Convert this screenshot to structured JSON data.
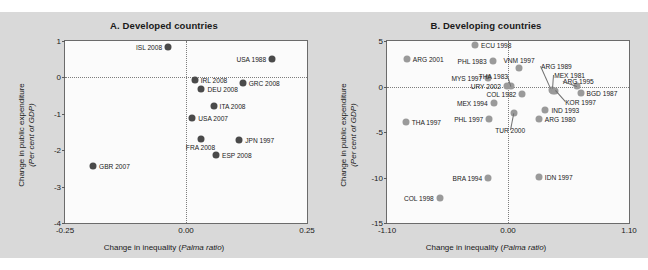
{
  "figure": {
    "background_color": "#d9d9d9",
    "plot_background_color": "#fbfbfb"
  },
  "panelA": {
    "title": "A. Developed countries",
    "xlabel_main": "Change in inequality (",
    "xlabel_italic": "Palma ratio",
    "xlabel_end": ")",
    "ylabel_line1": "Change in public expenditure",
    "ylabel_line2": "(Per cent of GDP)",
    "marker_color": "#4a4a4a"
  },
  "panelB": {
    "title": "B. Developing countries",
    "xlabel_main": "Change in inequality (",
    "xlabel_italic": "Palma ratio",
    "xlabel_end": ")",
    "ylabel_line1": "Change in public expenditure",
    "ylabel_line2": "(Per cent of GDP)",
    "marker_color": "#9a9a9a"
  },
  "chart_data": [
    {
      "type": "scatter",
      "title": "A. Developed countries",
      "xlabel": "Change in inequality (Palma ratio)",
      "ylabel": "Change in public expenditure (Per cent of GDP)",
      "xlim": [
        -0.25,
        0.25
      ],
      "ylim": [
        -4,
        1
      ],
      "xticks": [
        -0.25,
        0.0,
        0.25
      ],
      "xticklabels": [
        "-0.25",
        "0.00",
        "0.25"
      ],
      "yticks": [
        1,
        0,
        -1,
        -2,
        -3,
        -4
      ],
      "yticklabels": [
        "1",
        "0",
        "-1",
        "-2",
        "-3",
        "-4"
      ],
      "grid": false,
      "reference_lines": {
        "x": 0.0,
        "y": 0.0,
        "style": "dotted"
      },
      "legend": null,
      "points": [
        {
          "label": "ISL 2008",
          "x": -0.037,
          "y": 0.84,
          "label_side": "left"
        },
        {
          "label": "USA 1988",
          "x": 0.178,
          "y": 0.5,
          "label_side": "left"
        },
        {
          "label": "IRL 2008",
          "x": 0.018,
          "y": -0.07,
          "label_side": "right"
        },
        {
          "label": "GRC 2008",
          "x": 0.117,
          "y": -0.15,
          "label_side": "right"
        },
        {
          "label": "DEU 2008",
          "x": 0.032,
          "y": -0.33,
          "label_side": "right"
        },
        {
          "label": "ITA 2008",
          "x": 0.057,
          "y": -0.78,
          "label_side": "right"
        },
        {
          "label": "USA 2007",
          "x": 0.013,
          "y": -1.11,
          "label_side": "right"
        },
        {
          "label": "JPN 1997",
          "x": 0.11,
          "y": -1.72,
          "label_side": "right"
        },
        {
          "label": "FRA 2008",
          "x": 0.03,
          "y": -1.68,
          "label_side": "below"
        },
        {
          "label": "ESP 2008",
          "x": 0.062,
          "y": -2.14,
          "label_side": "right"
        },
        {
          "label": "GBR 2007",
          "x": -0.192,
          "y": -2.44,
          "label_side": "right"
        }
      ]
    },
    {
      "type": "scatter",
      "title": "B. Developing countries",
      "xlabel": "Change in inequality (Palma ratio)",
      "ylabel": "Change in public expenditure (Per cent of GDP)",
      "xlim": [
        -1.1,
        1.1
      ],
      "ylim": [
        -15,
        5
      ],
      "xticks": [
        -1.1,
        0.0,
        1.1
      ],
      "xticklabels": [
        "-1.10",
        "0.00",
        "1.10"
      ],
      "yticks": [
        5,
        0,
        -5,
        -10,
        -15
      ],
      "yticklabels": [
        "5",
        "0",
        "-5",
        "-10",
        "-15"
      ],
      "grid": false,
      "reference_lines": {
        "x": 0.0,
        "y": 0.0,
        "style": "dotted"
      },
      "legend": null,
      "points": [
        {
          "label": "ECU 1998",
          "x": -0.3,
          "y": 4.6,
          "label_side": "right"
        },
        {
          "label": "ARG 2001",
          "x": -0.92,
          "y": 3.05,
          "label_side": "right"
        },
        {
          "label": "PHL 1983",
          "x": -0.14,
          "y": 2.75,
          "label_side": "left"
        },
        {
          "label": "VNM 1997",
          "x": 0.1,
          "y": 2.05,
          "label_side": "above"
        },
        {
          "label": "MYS 1997",
          "x": -0.18,
          "y": 0.95,
          "label_side": "left"
        },
        {
          "label": "ARG 1989",
          "x": 0.4,
          "y": -0.4,
          "label_side": "leader"
        },
        {
          "label": "MEX 1981",
          "x": 0.41,
          "y": -0.45,
          "label_side": "leader"
        },
        {
          "label": "ARG 1995",
          "x": 0.63,
          "y": 0.05,
          "label_side": "leader"
        },
        {
          "label": "URY 2002",
          "x": -0.01,
          "y": 0.05,
          "label_side": "left"
        },
        {
          "label": "THA 1983",
          "x": 0.03,
          "y": 0.08,
          "label_side": "leader"
        },
        {
          "label": "BGD 1987",
          "x": 0.66,
          "y": -0.75,
          "label_side": "right"
        },
        {
          "label": "KOR 1997",
          "x": 0.43,
          "y": -0.52,
          "label_side": "leader"
        },
        {
          "label": "COL 1982",
          "x": 0.13,
          "y": -0.85,
          "label_side": "left"
        },
        {
          "label": "MEX 1994",
          "x": -0.13,
          "y": -1.85,
          "label_side": "left"
        },
        {
          "label": "IND 1993",
          "x": 0.34,
          "y": -2.6,
          "label_side": "right"
        },
        {
          "label": "TUR 2000",
          "x": 0.05,
          "y": -2.95,
          "label_side": "leader"
        },
        {
          "label": "ARG 1980",
          "x": 0.28,
          "y": -3.55,
          "label_side": "right"
        },
        {
          "label": "PHL 1997",
          "x": -0.17,
          "y": -3.6,
          "label_side": "left"
        },
        {
          "label": "THA 1997",
          "x": -0.93,
          "y": -3.95,
          "label_side": "right"
        },
        {
          "label": "BRA 1994",
          "x": -0.18,
          "y": -10.0,
          "label_side": "left"
        },
        {
          "label": "IDN 1997",
          "x": 0.28,
          "y": -9.95,
          "label_side": "right"
        },
        {
          "label": "COL 1998",
          "x": -0.62,
          "y": -12.2,
          "label_side": "left"
        }
      ]
    }
  ]
}
